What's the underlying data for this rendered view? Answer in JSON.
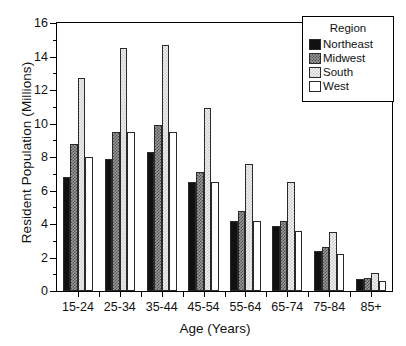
{
  "chart_data": {
    "type": "bar",
    "title": "",
    "xlabel": "Age (Years)",
    "ylabel": "Resident Population (Millions)",
    "categories": [
      "15-24",
      "25-34",
      "35-44",
      "45-54",
      "55-64",
      "65-74",
      "75-84",
      "85+"
    ],
    "series": [
      {
        "name": "Northeast",
        "color": "#111111",
        "values": [
          6.8,
          7.9,
          8.3,
          6.5,
          4.2,
          3.9,
          2.4,
          0.7
        ]
      },
      {
        "name": "Midwest",
        "color": "#9a9a9a",
        "values": [
          8.8,
          9.5,
          9.9,
          7.1,
          4.8,
          4.2,
          2.6,
          0.8
        ]
      },
      {
        "name": "South",
        "color": "#f0f0f0",
        "values": [
          12.7,
          14.5,
          14.7,
          10.9,
          7.6,
          6.5,
          3.5,
          1.1
        ]
      },
      {
        "name": "West",
        "color": "#ffffff",
        "values": [
          8.0,
          9.5,
          9.5,
          6.5,
          4.2,
          3.6,
          2.2,
          0.6
        ]
      }
    ],
    "ylim": [
      0,
      16
    ],
    "yticks": [
      0,
      2,
      4,
      6,
      8,
      10,
      12,
      14,
      16
    ],
    "ytick_labels": [
      "0",
      "2",
      "4",
      "6",
      "8",
      "10",
      "12",
      "14",
      "16"
    ],
    "yminor_step": 1,
    "grid": false,
    "legend_position": "top-right"
  },
  "legend": {
    "title": "Region",
    "entries": [
      {
        "label": "Northeast",
        "swatch": "northeast"
      },
      {
        "label": "Midwest",
        "swatch": "midwest"
      },
      {
        "label": "South",
        "swatch": "south"
      },
      {
        "label": "West",
        "swatch": "west"
      }
    ]
  }
}
